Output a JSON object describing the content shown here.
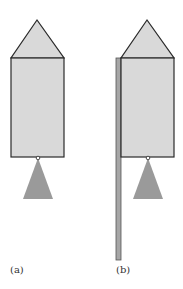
{
  "figure": {
    "panels": [
      {
        "id": "a",
        "label": "(a)",
        "has_rod": false
      },
      {
        "id": "b",
        "label": "(b)",
        "has_rod": true
      }
    ],
    "colors": {
      "body_fill": "#d9d9d9",
      "outline": "#2a2a2a",
      "flame_fill": "#9a9a9a",
      "rod_fill": "#a6a6a6"
    }
  }
}
